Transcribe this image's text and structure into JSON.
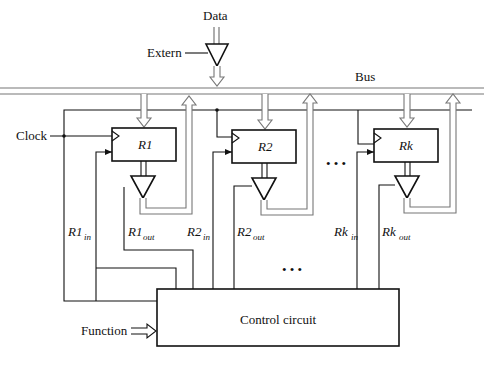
{
  "diagram": {
    "labels": {
      "data": "Data",
      "extern": "Extern",
      "bus": "Bus",
      "clock": "Clock",
      "function": "Function",
      "control_circuit": "Control circuit",
      "ellipsis": "• • •"
    },
    "registers": [
      {
        "name": "R",
        "index": "1",
        "in_label": "R1",
        "in_sub": "in",
        "out_label": "R1",
        "out_sub": "out"
      },
      {
        "name": "R",
        "index": "2",
        "in_label": "R2",
        "in_sub": "in",
        "out_label": "R2",
        "out_sub": "out"
      },
      {
        "name": "R",
        "index": "k",
        "in_label": "Rk",
        "in_sub": "in",
        "out_label": "Rk",
        "out_sub": "out"
      }
    ],
    "register_names": [
      "R1",
      "R2",
      "Rk"
    ],
    "colors": {
      "line": "#111111",
      "bus": "#777777",
      "background": "#ffffff"
    }
  }
}
